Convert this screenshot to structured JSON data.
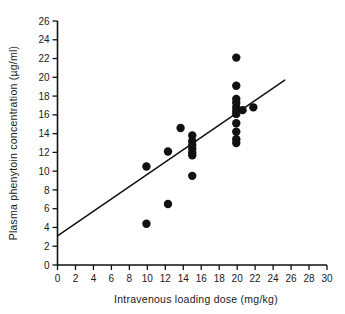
{
  "chart_data": {
    "type": "scatter",
    "title": "",
    "xlabel": "Intravenous loading dose (mg/kg)",
    "ylabel": "Plasma phenytoin concentration (µg/ml)",
    "xlim": [
      0,
      30
    ],
    "ylim": [
      0,
      26
    ],
    "xticks": [
      0,
      2,
      4,
      6,
      8,
      10,
      12,
      14,
      16,
      18,
      20,
      22,
      24,
      26,
      28,
      30
    ],
    "yticks": [
      0,
      2,
      4,
      6,
      8,
      10,
      12,
      14,
      16,
      18,
      20,
      22,
      24,
      26
    ],
    "xtick_labels": [
      "0",
      "2",
      "4",
      "6",
      "8",
      "10",
      "12",
      "14",
      "16",
      "18",
      "20",
      "22",
      "24",
      "26",
      "28",
      "30"
    ],
    "ytick_labels": [
      "0",
      "2",
      "4",
      "6",
      "8",
      "10",
      "12",
      "14",
      "16",
      "18",
      "20",
      "22",
      "24",
      "26"
    ],
    "grid": false,
    "legend": null,
    "marker": "filled-circle",
    "marker_color": "#111111",
    "marker_size": 4.2,
    "points": [
      {
        "x": 9.9,
        "y": 10.5
      },
      {
        "x": 9.9,
        "y": 4.4
      },
      {
        "x": 12.3,
        "y": 12.1
      },
      {
        "x": 12.3,
        "y": 6.5
      },
      {
        "x": 13.7,
        "y": 14.6
      },
      {
        "x": 15.0,
        "y": 13.8
      },
      {
        "x": 15.0,
        "y": 13.2
      },
      {
        "x": 15.0,
        "y": 12.8
      },
      {
        "x": 15.0,
        "y": 12.4
      },
      {
        "x": 15.0,
        "y": 12.0
      },
      {
        "x": 15.0,
        "y": 11.7
      },
      {
        "x": 15.0,
        "y": 9.5
      },
      {
        "x": 19.9,
        "y": 22.1
      },
      {
        "x": 19.9,
        "y": 19.1
      },
      {
        "x": 19.9,
        "y": 17.7
      },
      {
        "x": 19.9,
        "y": 17.3
      },
      {
        "x": 19.9,
        "y": 16.8
      },
      {
        "x": 19.9,
        "y": 16.4
      },
      {
        "x": 19.9,
        "y": 16.1
      },
      {
        "x": 19.9,
        "y": 15.1
      },
      {
        "x": 19.9,
        "y": 14.2
      },
      {
        "x": 19.9,
        "y": 13.4
      },
      {
        "x": 19.9,
        "y": 13.0
      },
      {
        "x": 20.6,
        "y": 16.5
      },
      {
        "x": 21.8,
        "y": 16.8
      }
    ],
    "trend_line": {
      "type": "linear-regression",
      "x_start": 0.0,
      "y_start": 3.1,
      "x_end": 25.3,
      "y_end": 19.7
    },
    "axis_color": "#111111"
  }
}
